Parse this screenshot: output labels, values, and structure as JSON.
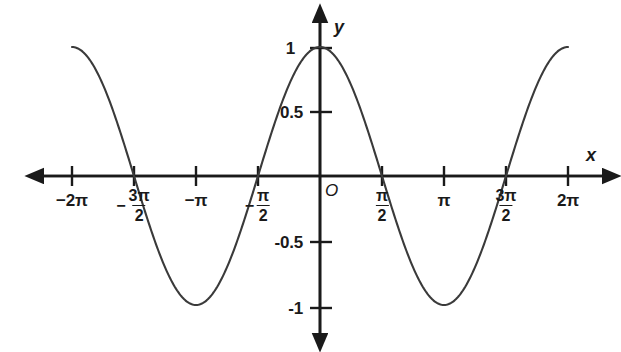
{
  "chart_data": {
    "type": "line",
    "title": "",
    "function": "y = cos(x)",
    "xlabel": "x",
    "ylabel": "y",
    "origin_label": "O",
    "xlim": [
      -7.2257,
      7.4385
    ],
    "ylim": [
      -1.26,
      1.26
    ],
    "grid": false,
    "legend": null,
    "x_tick_labels": [
      "-2π",
      "-3π/2",
      "-π",
      "-π/2",
      "π/2",
      "π",
      "3π/2",
      "2π"
    ],
    "x_tick_values": [
      -6.2832,
      -4.7124,
      -3.1416,
      -1.5708,
      1.5708,
      3.1416,
      4.7124,
      6.2832
    ],
    "y_tick_labels": [
      "1",
      "0.5",
      "-0.5",
      "-1"
    ],
    "y_tick_values": [
      1,
      0.5,
      -0.5,
      -1
    ],
    "series": [
      {
        "name": "cos(x)",
        "color": "#3a3a3a",
        "x": [
          -6.2832,
          -5.8905,
          -5.4978,
          -5.1051,
          -4.7124,
          -4.3197,
          -3.927,
          -3.5343,
          -3.1416,
          -2.7489,
          -2.3562,
          -1.9635,
          -1.5708,
          -1.1781,
          -0.7854,
          -0.3927,
          0,
          0.3927,
          0.7854,
          1.1781,
          1.5708,
          1.9635,
          2.3562,
          2.7489,
          3.1416,
          3.5343,
          3.927,
          4.3197,
          4.7124,
          5.1051,
          5.4978,
          5.8905,
          6.2832
        ],
        "y": [
          1,
          0.9239,
          0.7071,
          0.3827,
          0,
          -0.3827,
          -0.7071,
          -0.9239,
          -1,
          -0.9239,
          -0.7071,
          -0.3827,
          0,
          0.3827,
          0.7071,
          0.9239,
          1,
          0.9239,
          0.7071,
          0.3827,
          0,
          -0.3827,
          -0.7071,
          -0.9239,
          -1,
          -0.9239,
          -0.7071,
          -0.3827,
          0,
          0.3827,
          0.7071,
          0.9239,
          1
        ]
      }
    ],
    "maxima": [
      {
        "x": -6.2832,
        "y": 1
      },
      {
        "x": 0,
        "y": 1
      },
      {
        "x": 6.2832,
        "y": 1
      }
    ],
    "minima": [
      {
        "x": -3.1416,
        "y": -1
      },
      {
        "x": 3.1416,
        "y": -1
      }
    ],
    "zeros": [
      -4.7124,
      -1.5708,
      1.5708,
      4.7124
    ],
    "axis_color": "#1a1a1a",
    "background_color": "#ffffff"
  },
  "labels": {
    "x_axis": "x",
    "y_axis": "y",
    "origin": "O",
    "y1": "1",
    "y05": "0.5",
    "yneg05": "-0.5",
    "yneg1": "-1",
    "x_neg2pi": "−2π",
    "x_negpi": "−π",
    "x_pi": "π",
    "x_2pi": "2π",
    "minus": "−",
    "frac_3pi_num": "3π",
    "frac_pi_num": "π",
    "frac_den": "2"
  }
}
